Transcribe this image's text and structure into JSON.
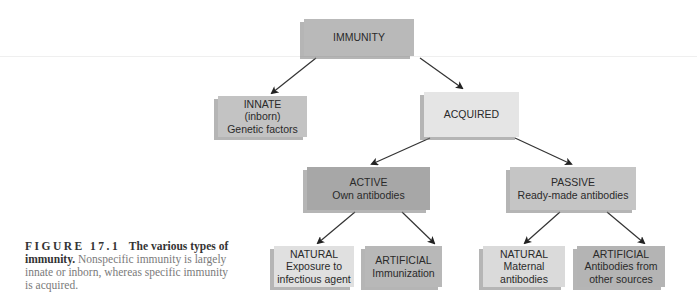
{
  "diagram": {
    "type": "tree",
    "nodes": {
      "immunity": {
        "lines": [
          "IMMUNITY"
        ],
        "fill": "#b9b9b9"
      },
      "innate": {
        "lines": [
          "INNATE",
          "(inborn)",
          "Genetic factors"
        ],
        "fill": "#c3c3c3"
      },
      "acquired": {
        "lines": [
          "ACQUIRED"
        ],
        "fill": "#e5e5e5"
      },
      "active": {
        "lines": [
          "ACTIVE",
          "Own antibodies"
        ],
        "fill": "#a7a7a7"
      },
      "passive": {
        "lines": [
          "PASSIVE",
          "Ready-made antibodies"
        ],
        "fill": "#c5c5c5"
      },
      "active_natural": {
        "lines": [
          "NATURAL",
          "Exposure to",
          "infectious agent"
        ],
        "fill": "#e0e0e0"
      },
      "active_artificial": {
        "lines": [
          "ARTIFICIAL",
          "Immunization"
        ],
        "fill": "#b8b8b8"
      },
      "passive_natural": {
        "lines": [
          "NATURAL",
          "Maternal",
          "antibodies"
        ],
        "fill": "#dadada"
      },
      "passive_artificial": {
        "lines": [
          "ARTIFICIAL",
          "Antibodies from",
          "other sources"
        ],
        "fill": "#b4b4b4"
      }
    },
    "edges": [
      [
        "immunity",
        "innate"
      ],
      [
        "immunity",
        "acquired"
      ],
      [
        "acquired",
        "active"
      ],
      [
        "acquired",
        "passive"
      ],
      [
        "active",
        "active_natural"
      ],
      [
        "active",
        "active_artificial"
      ],
      [
        "passive",
        "passive_natural"
      ],
      [
        "passive",
        "passive_artificial"
      ]
    ],
    "arrow_color": "#222222"
  },
  "caption": {
    "figure_label": "FIGURE 17.1",
    "title": "The various types of immunity.",
    "body": "Nonspecific immunity is largely innate or inborn, whereas specific immunity is acquired."
  }
}
